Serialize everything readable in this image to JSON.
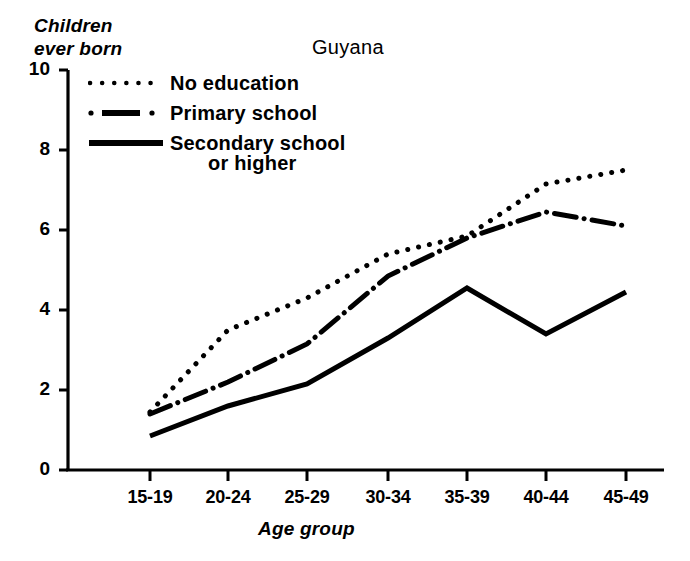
{
  "chart_data": {
    "type": "line",
    "title": "Guyana",
    "xlabel": "Age group",
    "ylabel": "Children ever born",
    "categories": [
      "15-19",
      "20-24",
      "25-29",
      "30-34",
      "35-39",
      "40-44",
      "45-49"
    ],
    "ylim": [
      0,
      10
    ],
    "yticks": [
      0,
      2,
      4,
      6,
      8,
      10
    ],
    "grid": false,
    "legend_position": "upper-left-inside",
    "series": [
      {
        "name": "No education",
        "style": "dotted",
        "values": [
          1.45,
          3.5,
          4.3,
          5.4,
          5.85,
          7.15,
          7.5
        ]
      },
      {
        "name": "Primary school",
        "style": "dash-dot",
        "values": [
          1.4,
          2.2,
          3.15,
          4.85,
          5.8,
          6.45,
          6.1
        ]
      },
      {
        "name": "Secondary school or higher",
        "style": "solid",
        "values": [
          0.85,
          1.6,
          2.15,
          3.3,
          4.55,
          3.4,
          4.45
        ]
      }
    ]
  },
  "axis": {
    "y_tick_labels": [
      "10",
      "8",
      "6",
      "4",
      "2",
      "0"
    ],
    "x_tick_labels": [
      "15-19",
      "20-24",
      "25-29",
      "30-34",
      "35-39",
      "40-44",
      "45-49"
    ],
    "y_axis_title_line1": "Children",
    "y_axis_title_line2": "ever born",
    "x_axis_title": "Age group"
  },
  "legend": {
    "items": [
      {
        "label": "No education",
        "style": "dotted"
      },
      {
        "label": "Primary school",
        "style": "dash-dot"
      },
      {
        "label": "Secondary school",
        "style": "solid"
      }
    ],
    "continuation_label": "or higher"
  },
  "colors": {
    "ink": "#000000",
    "paper": "#ffffff"
  }
}
